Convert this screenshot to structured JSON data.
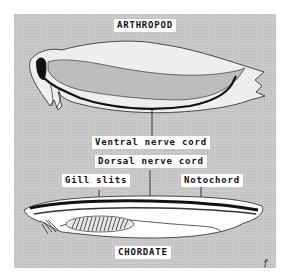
{
  "diagram": {
    "title_top": "ARTHROPOD",
    "title_bottom": "CHORDATE",
    "labels": {
      "ventral_nerve_cord": "Ventral nerve cord",
      "dorsal_nerve_cord": "Dorsal nerve cord",
      "gill_slits": "Gill slits",
      "notochord": "Notochord"
    },
    "signature": "ꝭ"
  },
  "colors": {
    "background": "#ffffff",
    "panel": "#c9c9c9",
    "body_fill": "#eeeeee",
    "gut_fill": "#bdbdbd",
    "nerve_cord": "#111111"
  }
}
